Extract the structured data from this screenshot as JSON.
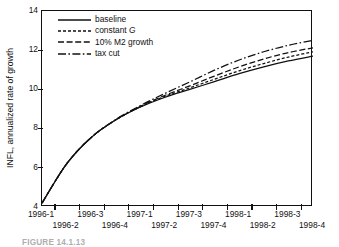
{
  "figure": {
    "caption": "FIGURE 14.1.13"
  },
  "chart_data": {
    "type": "line",
    "title": "",
    "xlabel": "",
    "ylabel": "INFL, annualized rate of growth",
    "ylim": [
      4,
      14
    ],
    "yticks": [
      4,
      6,
      8,
      10,
      12,
      14
    ],
    "ytick_labels": [
      "4",
      "6",
      "8",
      "10",
      "12",
      "14"
    ],
    "grid": false,
    "legend_position": "upper left",
    "categories": [
      "1996-1",
      "1996-2",
      "1996-3",
      "1996-4",
      "1997-1",
      "1997-2",
      "1997-3",
      "1997-4",
      "1998-1",
      "1998-2",
      "1998-3",
      "1998-4"
    ],
    "xtick_labels_top": [
      "1996-1",
      "1996-3",
      "1997-1",
      "1997-3",
      "1998-1",
      "1998-3"
    ],
    "xtick_labels_bottom": [
      "1996-2",
      "1996-4",
      "1997-2",
      "1997-4",
      "1998-2",
      "1998-4"
    ],
    "series": [
      {
        "name": "baseline",
        "style": "solid",
        "values": [
          4.2,
          6.2,
          7.55,
          8.45,
          9.1,
          9.6,
          10.0,
          10.4,
          10.8,
          11.15,
          11.45,
          11.7
        ]
      },
      {
        "name": "constant G",
        "style": "dotted",
        "values": [
          4.2,
          6.2,
          7.55,
          8.45,
          9.12,
          9.65,
          10.08,
          10.52,
          10.95,
          11.32,
          11.65,
          11.92
        ]
      },
      {
        "name": "10% M2 growth",
        "style": "dashed",
        "values": [
          4.2,
          6.2,
          7.55,
          8.45,
          9.14,
          9.7,
          10.18,
          10.68,
          11.15,
          11.55,
          11.88,
          12.12
        ]
      },
      {
        "name": "tax cut",
        "style": "dashdot",
        "values": [
          4.2,
          6.2,
          7.55,
          8.47,
          9.18,
          9.8,
          10.38,
          10.98,
          11.5,
          11.92,
          12.25,
          12.5
        ]
      }
    ],
    "legend_entries": [
      {
        "label": "baseline",
        "style": "solid"
      },
      {
        "label": "constant G",
        "style": "dotted",
        "italic_tail": "G",
        "label_prefix": "constant "
      },
      {
        "label": "10% M2 growth",
        "style": "dashed"
      },
      {
        "label": "tax cut",
        "style": "dashdot"
      }
    ],
    "colors": {
      "line": "#111111",
      "axis": "#111111",
      "background": "#ffffff"
    }
  }
}
